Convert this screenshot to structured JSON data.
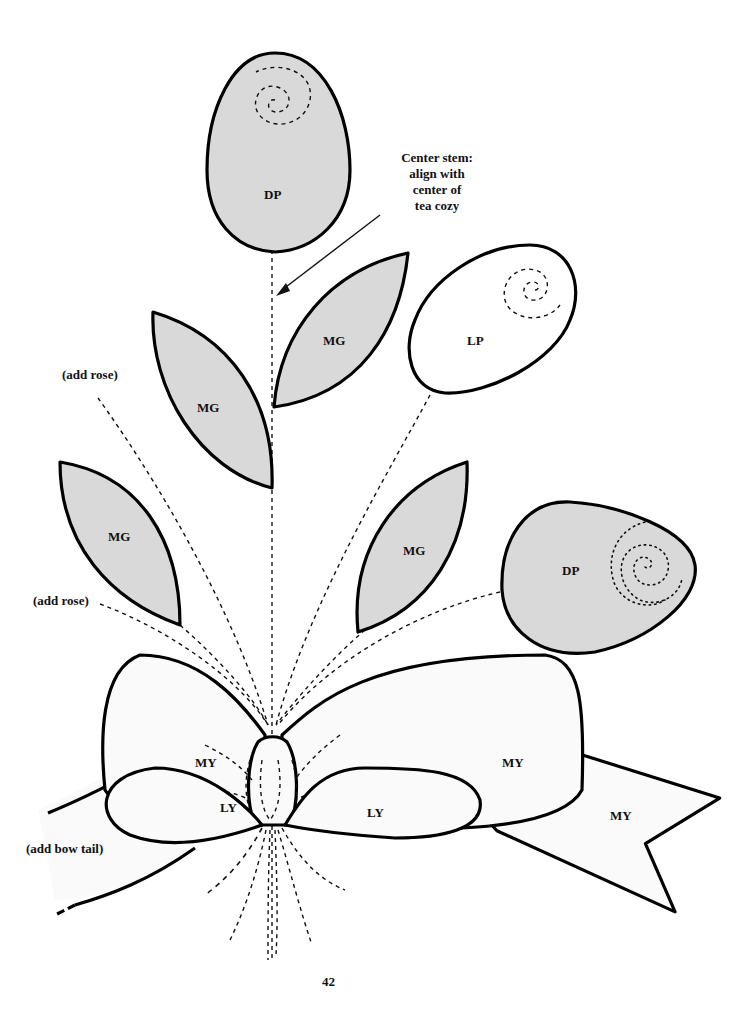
{
  "page": {
    "number": "42"
  },
  "colors": {
    "dark_pink": "#d9d9d9",
    "medium_green": "#d9d9d9",
    "light_pink": "#ffffff",
    "yellow": "#fafafa",
    "outline": "#000000"
  },
  "annotations": {
    "center_stem": [
      "Center stem:",
      "align with",
      "center of",
      "tea cozy"
    ],
    "add_rose_1": "(add rose)",
    "add_rose_2": "(add rose)",
    "add_bow_tail": "(add bow tail)"
  },
  "pieces": {
    "rose_top": "DP",
    "rose_right": "DP",
    "rose_light": "LP",
    "leaf_upper_left": "MG",
    "leaf_upper_right": "MG",
    "leaf_lower_left": "MG",
    "leaf_lower_right": "MG",
    "bow_loop_left": "MY",
    "bow_loop_right": "MY",
    "bow_inner_left": "LY",
    "bow_inner_right": "LY",
    "bow_tail_right": "MY"
  }
}
